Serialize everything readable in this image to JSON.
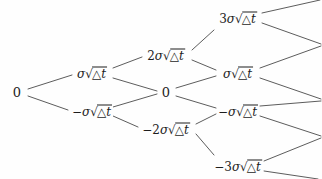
{
  "diagram": {
    "type": "recombining-binomial-tree",
    "steps": 4,
    "unit_symbol": "σ√(△t)",
    "line_color": "#4a4a4a",
    "text_color": "#1d1d1d",
    "background_color": "#fefefe",
    "columns": [
      {
        "index": 0,
        "x": 17
      },
      {
        "index": 1,
        "x": 92
      },
      {
        "index": 2,
        "x": 166
      },
      {
        "index": 3,
        "x": 238
      },
      {
        "index": 4,
        "x": 318
      }
    ],
    "rows": [
      {
        "level": 3,
        "y": 18
      },
      {
        "level": 2,
        "y": 55
      },
      {
        "level": 1,
        "y": 73
      },
      {
        "level": 0,
        "y": 92
      },
      {
        "level": -1,
        "y": 111
      },
      {
        "level": -2,
        "y": 129
      },
      {
        "level": -3,
        "y": 166
      }
    ],
    "nodes": [
      {
        "id": "n0",
        "step": 0,
        "level": 0,
        "x": 17,
        "y": 92,
        "coefficient": "0",
        "has_radical": false,
        "sign": "",
        "label_plain": "0",
        "font_size": 13
      },
      {
        "id": "n1u",
        "step": 1,
        "level": 1,
        "x": 92,
        "y": 73,
        "coefficient": "",
        "has_radical": true,
        "sign": "",
        "label_plain": "σ√(△t)",
        "font_size": 12
      },
      {
        "id": "n1d",
        "step": 1,
        "level": -1,
        "x": 92,
        "y": 111,
        "coefficient": "",
        "has_radical": true,
        "sign": "−",
        "label_plain": "−σ√(△t)",
        "font_size": 12
      },
      {
        "id": "n2u",
        "step": 2,
        "level": 2,
        "x": 166,
        "y": 55,
        "coefficient": "2",
        "has_radical": true,
        "sign": "",
        "label_plain": "2σ√(△t)",
        "font_size": 12
      },
      {
        "id": "n2m",
        "step": 2,
        "level": 0,
        "x": 166,
        "y": 92,
        "coefficient": "0",
        "has_radical": false,
        "sign": "",
        "label_plain": "0",
        "font_size": 13
      },
      {
        "id": "n2d",
        "step": 2,
        "level": -2,
        "x": 166,
        "y": 129,
        "coefficient": "2",
        "has_radical": true,
        "sign": "−",
        "label_plain": "−2σ√(△t)",
        "font_size": 12
      },
      {
        "id": "n3u",
        "step": 3,
        "level": 3,
        "x": 238,
        "y": 18,
        "coefficient": "3",
        "has_radical": true,
        "sign": "",
        "label_plain": "3σ√(△t)",
        "font_size": 12
      },
      {
        "id": "n3mu",
        "step": 3,
        "level": 1,
        "x": 238,
        "y": 73,
        "coefficient": "",
        "has_radical": true,
        "sign": "",
        "label_plain": "σ√(△t)",
        "font_size": 12
      },
      {
        "id": "n3md",
        "step": 3,
        "level": -1,
        "x": 238,
        "y": 111,
        "coefficient": "",
        "has_radical": true,
        "sign": "−",
        "label_plain": "−σ√(△t)",
        "font_size": 12
      },
      {
        "id": "n3d",
        "step": 3,
        "level": -3,
        "x": 238,
        "y": 166,
        "coefficient": "3",
        "has_radical": true,
        "sign": "−",
        "label_plain": "−3σ√(△t)",
        "font_size": 12
      }
    ],
    "edges": [
      {
        "from": "n0",
        "to": "n1u",
        "x1": 28,
        "y1": 89,
        "x2": 72,
        "y2": 75
      },
      {
        "from": "n0",
        "to": "n1d",
        "x1": 28,
        "y1": 96,
        "x2": 68,
        "y2": 110
      },
      {
        "from": "n1u",
        "to": "n2u",
        "x1": 113,
        "y1": 68,
        "x2": 142,
        "y2": 57
      },
      {
        "from": "n1u",
        "to": "n2m",
        "x1": 113,
        "y1": 78,
        "x2": 157,
        "y2": 91
      },
      {
        "from": "n1d",
        "to": "n2m",
        "x1": 113,
        "y1": 107,
        "x2": 157,
        "y2": 94
      },
      {
        "from": "n1d",
        "to": "n2d",
        "x1": 113,
        "y1": 116,
        "x2": 138,
        "y2": 127
      },
      {
        "from": "n2u",
        "to": "n3u",
        "x1": 192,
        "y1": 50,
        "x2": 214,
        "y2": 30
      },
      {
        "from": "n2u",
        "to": "n3mu",
        "x1": 192,
        "y1": 60,
        "x2": 216,
        "y2": 70
      },
      {
        "from": "n2m",
        "to": "n3mu",
        "x1": 176,
        "y1": 88,
        "x2": 216,
        "y2": 76
      },
      {
        "from": "n2m",
        "to": "n3md",
        "x1": 176,
        "y1": 96,
        "x2": 216,
        "y2": 108
      },
      {
        "from": "n2d",
        "to": "n3md",
        "x1": 196,
        "y1": 124,
        "x2": 216,
        "y2": 114
      },
      {
        "from": "n2d",
        "to": "n3d",
        "x1": 196,
        "y1": 134,
        "x2": 214,
        "y2": 155
      },
      {
        "from": "n3u",
        "to": "t4a",
        "x1": 262,
        "y1": 13,
        "x2": 320,
        "y2": 0
      },
      {
        "from": "n3u",
        "to": "t4b",
        "x1": 262,
        "y1": 23,
        "x2": 321,
        "y2": 44
      },
      {
        "from": "n3mu",
        "to": "t4b",
        "x1": 260,
        "y1": 68,
        "x2": 321,
        "y2": 46
      },
      {
        "from": "n3mu",
        "to": "t4c",
        "x1": 260,
        "y1": 78,
        "x2": 321,
        "y2": 99
      },
      {
        "from": "n3md",
        "to": "t4c",
        "x1": 260,
        "y1": 106,
        "x2": 321,
        "y2": 101
      },
      {
        "from": "n3md",
        "to": "t4d",
        "x1": 260,
        "y1": 116,
        "x2": 321,
        "y2": 136
      },
      {
        "from": "n3d",
        "to": "t4d",
        "x1": 264,
        "y1": 161,
        "x2": 321,
        "y2": 138
      },
      {
        "from": "n3d",
        "to": "t4e",
        "x1": 264,
        "y1": 171,
        "x2": 318,
        "y2": 179
      }
    ]
  }
}
